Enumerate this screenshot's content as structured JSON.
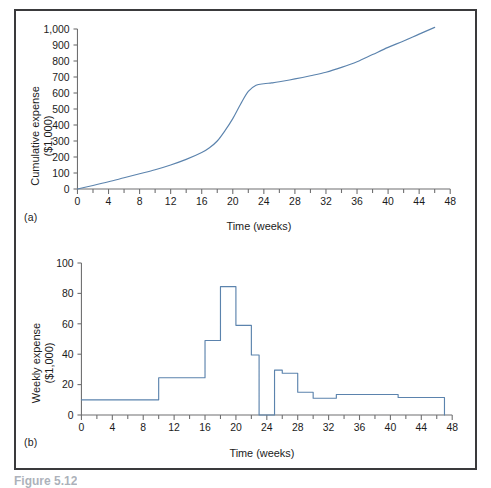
{
  "figure": {
    "caption": "Figure 5.12",
    "panel_a_tag": "(a)",
    "panel_b_tag": "(b)",
    "frame_color": "#3a3a3c",
    "series_color": "#5b83ad",
    "axis_color": "#6f6f70"
  },
  "chart_data": [
    {
      "id": "cumulative-expense",
      "type": "line",
      "title": "",
      "panel": "(a)",
      "xlabel": "Time (weeks)",
      "ylabel": "Cumulative expense ($1,000)",
      "ylabel_line1": "Cumulative expense",
      "ylabel_line2": "($1,000)",
      "xlim": [
        0,
        48
      ],
      "ylim": [
        0,
        1000
      ],
      "xticks": [
        0,
        2,
        4,
        6,
        8,
        10,
        12,
        14,
        16,
        18,
        20,
        22,
        24,
        26,
        28,
        30,
        32,
        34,
        36,
        38,
        40,
        42,
        44,
        46,
        48
      ],
      "xticklabels": [
        "0",
        "",
        "4",
        "",
        "8",
        "",
        "12",
        "",
        "16",
        "",
        "20",
        "",
        "24",
        "",
        "28",
        "",
        "32",
        "",
        "36",
        "",
        "40",
        "",
        "44",
        "",
        "48"
      ],
      "yticks": [
        0,
        100,
        200,
        300,
        400,
        500,
        600,
        700,
        800,
        900,
        1000
      ],
      "yticklabels": [
        "0",
        "100",
        "200",
        "300",
        "400",
        "500",
        "600",
        "700",
        "800",
        "900",
        "1,000"
      ],
      "grid": false,
      "legend": "none",
      "x": [
        0,
        2,
        4,
        6,
        8,
        10,
        12,
        14,
        16,
        17,
        18,
        19,
        20,
        21,
        22,
        23,
        24,
        25,
        26,
        28,
        30,
        32,
        34,
        36,
        38,
        40,
        42,
        44,
        46
      ],
      "values": [
        0,
        22,
        45,
        70,
        95,
        120,
        150,
        185,
        228,
        258,
        300,
        365,
        440,
        530,
        610,
        648,
        658,
        663,
        670,
        688,
        708,
        730,
        760,
        795,
        840,
        885,
        925,
        968,
        1010
      ]
    },
    {
      "id": "weekly-expense",
      "type": "step",
      "title": "",
      "panel": "(b)",
      "xlabel": "Time (weeks)",
      "ylabel": "Weekly expense ($1,000)",
      "ylabel_line1": "Weekly expense",
      "ylabel_line2": "($1,000)",
      "xlim": [
        0,
        48
      ],
      "ylim": [
        0,
        100
      ],
      "xticks": [
        0,
        2,
        4,
        6,
        8,
        10,
        12,
        14,
        16,
        18,
        20,
        22,
        24,
        26,
        28,
        30,
        32,
        34,
        36,
        38,
        40,
        42,
        44,
        46,
        48
      ],
      "xticklabels": [
        "0",
        "",
        "4",
        "",
        "8",
        "",
        "12",
        "",
        "16",
        "",
        "20",
        "",
        "24",
        "",
        "28",
        "",
        "32",
        "",
        "36",
        "",
        "40",
        "",
        "44",
        "",
        "48"
      ],
      "yticks": [
        0,
        20,
        40,
        60,
        80,
        100
      ],
      "yticklabels": [
        "0",
        "20",
        "40",
        "60",
        "80",
        "100"
      ],
      "grid": false,
      "legend": "none",
      "steps": [
        {
          "start": 0,
          "end": 10,
          "value": 10
        },
        {
          "start": 10,
          "end": 16,
          "value": 24.5
        },
        {
          "start": 16,
          "end": 18,
          "value": 49
        },
        {
          "start": 18,
          "end": 20,
          "value": 84.5
        },
        {
          "start": 20,
          "end": 22,
          "value": 59
        },
        {
          "start": 22,
          "end": 23,
          "value": 39.5
        },
        {
          "start": 23,
          "end": 25,
          "value": 0
        },
        {
          "start": 25,
          "end": 26,
          "value": 29.5
        },
        {
          "start": 26,
          "end": 28,
          "value": 27.5
        },
        {
          "start": 28,
          "end": 30,
          "value": 15
        },
        {
          "start": 30,
          "end": 33,
          "value": 11
        },
        {
          "start": 33,
          "end": 41,
          "value": 13.5
        },
        {
          "start": 41,
          "end": 47,
          "value": 11.5
        }
      ]
    }
  ]
}
